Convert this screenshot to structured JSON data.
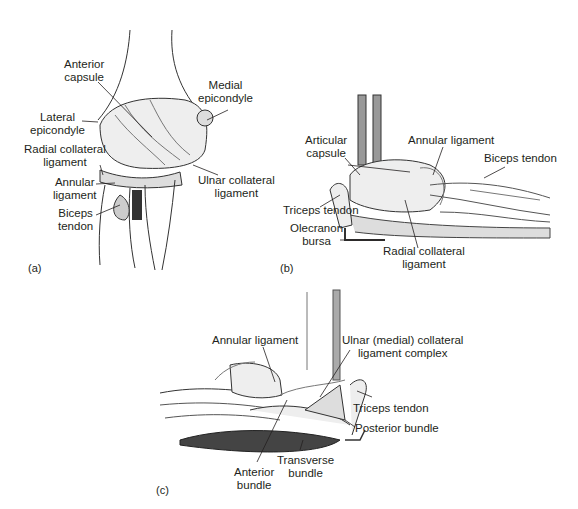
{
  "figure": {
    "panels": [
      {
        "id": "a",
        "letter": "(a)",
        "labels": {
          "anterior_capsule": [
            "Anterior",
            "capsule"
          ],
          "medial_epicondyle": [
            "Medial",
            "epicondyle"
          ],
          "lateral_epicondyle": [
            "Lateral",
            "epicondyle"
          ],
          "radial_collateral": [
            "Radial collateral",
            "ligament"
          ],
          "ulnar_collateral": [
            "Ulnar collateral",
            "ligament"
          ],
          "annular": [
            "Annular",
            "ligament"
          ],
          "biceps": [
            "Biceps",
            "tendon"
          ]
        }
      },
      {
        "id": "b",
        "letter": "(b)",
        "labels": {
          "articular_capsule": [
            "Articular",
            "capsule"
          ],
          "annular": "Annular ligament",
          "biceps": "Biceps tendon",
          "triceps": "Triceps tendon",
          "olecranon": [
            "Olecranon",
            "bursa"
          ],
          "radial_collateral": [
            "Radial collateral",
            "ligament"
          ]
        }
      },
      {
        "id": "c",
        "letter": "(c)",
        "labels": {
          "annular": "Annular ligament",
          "ulnar_complex": [
            "Ulnar (medial) collateral",
            "ligament complex"
          ],
          "triceps": "Triceps tendon",
          "posterior_bundle": "Posterior bundle",
          "anterior_bundle": [
            "Anterior",
            "bundle"
          ],
          "transverse_bundle": [
            "Transverse",
            "bundle"
          ]
        }
      }
    ],
    "colors": {
      "ink": "#231f20",
      "shade": "#6b6b6b",
      "light": "#c8c8c8"
    }
  }
}
